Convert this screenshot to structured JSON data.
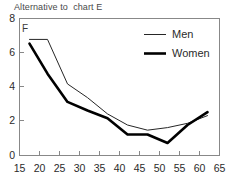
{
  "chart_data": {
    "type": "line",
    "title": "Alternative to  chart E",
    "xlabel": "",
    "ylabel": "",
    "xlim": [
      15,
      65
    ],
    "ylim": [
      0,
      8
    ],
    "xticks": [
      "15",
      "20",
      "25",
      "30",
      "35",
      "40",
      "45",
      "50",
      "55",
      "60",
      "65"
    ],
    "yticks": [
      "0",
      "2",
      "4",
      "6",
      "8"
    ],
    "grid": false,
    "legend_position": "top-right",
    "annotation": "F",
    "series": [
      {
        "name": "Men",
        "style": "thin",
        "x": [
          17.5,
          22,
          27,
          32,
          37,
          42,
          47,
          52,
          57,
          62
        ],
        "values": [
          6.75,
          6.75,
          4.15,
          3.35,
          2.4,
          1.75,
          1.45,
          1.6,
          1.85,
          2.3
        ]
      },
      {
        "name": "Women",
        "style": "thick",
        "x": [
          17.5,
          22,
          27,
          32,
          37,
          42,
          47,
          52,
          57,
          62
        ],
        "values": [
          6.5,
          4.75,
          3.1,
          2.6,
          2.15,
          1.2,
          1.2,
          0.7,
          1.75,
          2.5
        ]
      }
    ]
  },
  "legend": {
    "items": [
      {
        "label": "Men"
      },
      {
        "label": "Women"
      }
    ]
  },
  "axis": {
    "x_tick_labels": [
      "15",
      "20",
      "25",
      "30",
      "35",
      "40",
      "45",
      "50",
      "55",
      "60",
      "65"
    ],
    "y_tick_labels": [
      "8",
      "6",
      "4",
      "2",
      "0"
    ]
  }
}
